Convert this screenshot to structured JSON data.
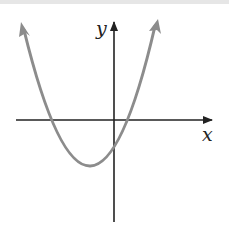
{
  "diagram": {
    "type": "function-graph",
    "axes": {
      "x_label": "x",
      "y_label": "y"
    },
    "curve": {
      "kind": "parabola",
      "opens": "up",
      "color": "#8c8c8c",
      "vertex_quadrant": "III",
      "x_intercepts": [
        "negative",
        "positive"
      ],
      "y_intercept": "negative"
    },
    "colors": {
      "axis": "#222222",
      "curve": "#8c8c8c",
      "background": "#ffffff"
    }
  }
}
